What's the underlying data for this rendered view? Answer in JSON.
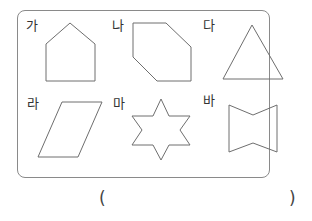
{
  "question": {
    "shapes": [
      {
        "label": "가",
        "kind": "pentagon-house",
        "points": "70,23 95,44 95,81 46,81 46,44"
      },
      {
        "label": "나",
        "kind": "hexagon",
        "points": "133,23 166,23 191,47 191,81 157,81 133,57"
      },
      {
        "label": "다",
        "kind": "triangle",
        "points": "252,25 283,79 223,79"
      },
      {
        "label": "라",
        "kind": "parallelogram",
        "points": "62,102 102,102 78,157 38,157"
      },
      {
        "label": "마",
        "kind": "six-pointed-star",
        "points": "161,99 169,116 190,116 180,130 190,145 169,145 161,160 153,145 132,145 142,130 132,116 153,116"
      },
      {
        "label": "바",
        "kind": "bowtie-hexagon",
        "points": "229,105 253,115 277,105 277,152 253,143 229,152"
      }
    ],
    "answer": {
      "open_paren": "(",
      "close_paren": ")",
      "value": ""
    }
  },
  "colors": {
    "stroke": "#6e6e6e",
    "frame": "#8a8a8a",
    "text": "#333333"
  }
}
